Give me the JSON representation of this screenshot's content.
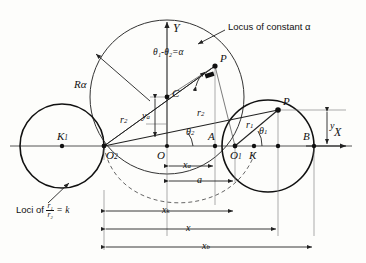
{
  "figure": {
    "type": "geometry-diagram",
    "axes": {
      "x_label": "X",
      "y_label": "Y"
    },
    "annotations": {
      "locus_alpha": "Locus of constant α",
      "angle_relation": "θ₁-θ₂=α",
      "loci_prefix": "Loci of",
      "loci_numerator": "r₁",
      "loci_denominator": "r₂",
      "loci_suffix": "= k",
      "radius_alpha": "Rα"
    },
    "points": [
      {
        "id": "origin",
        "label": "O",
        "sub": ""
      },
      {
        "id": "center2",
        "label": "O",
        "sub": "2"
      },
      {
        "id": "center1",
        "label": "O",
        "sub": "1"
      },
      {
        "id": "pointC",
        "label": "C",
        "sub": ""
      },
      {
        "id": "pointA",
        "label": "A",
        "sub": ""
      },
      {
        "id": "pointB",
        "label": "B",
        "sub": ""
      },
      {
        "id": "pointK",
        "label": "K",
        "sub": ""
      },
      {
        "id": "pointK1",
        "label": "K",
        "sub": "1"
      },
      {
        "id": "pointP_upper",
        "label": "P",
        "sub": ""
      },
      {
        "id": "pointP_lower",
        "label": "P",
        "sub": ""
      }
    ],
    "segments": [
      {
        "id": "r1",
        "label": "r",
        "sub": "1"
      },
      {
        "id": "r2",
        "label": "r",
        "sub": "2"
      },
      {
        "id": "r2b",
        "label": "r",
        "sub": "2"
      }
    ],
    "angles": [
      {
        "id": "theta1",
        "label": "θ",
        "sub": "1"
      },
      {
        "id": "theta2",
        "label": "θ",
        "sub": "2"
      }
    ],
    "dimensions": [
      {
        "id": "y_a",
        "label": "y",
        "sub": "a",
        "orientation": "vertical"
      },
      {
        "id": "y",
        "label": "y",
        "sub": "",
        "orientation": "vertical"
      },
      {
        "id": "x_a",
        "label": "x",
        "sub": "a",
        "orientation": "horizontal"
      },
      {
        "id": "a",
        "label": "a",
        "sub": "",
        "orientation": "horizontal"
      },
      {
        "id": "x_k",
        "label": "x",
        "sub": "k",
        "orientation": "horizontal"
      },
      {
        "id": "x",
        "label": "x",
        "sub": "",
        "orientation": "horizontal"
      },
      {
        "id": "x_b",
        "label": "x",
        "sub": "b",
        "orientation": "horizontal"
      }
    ],
    "colors": {
      "ink": "#111111",
      "axis": "#444444",
      "paper": "#fdfdfb"
    }
  }
}
